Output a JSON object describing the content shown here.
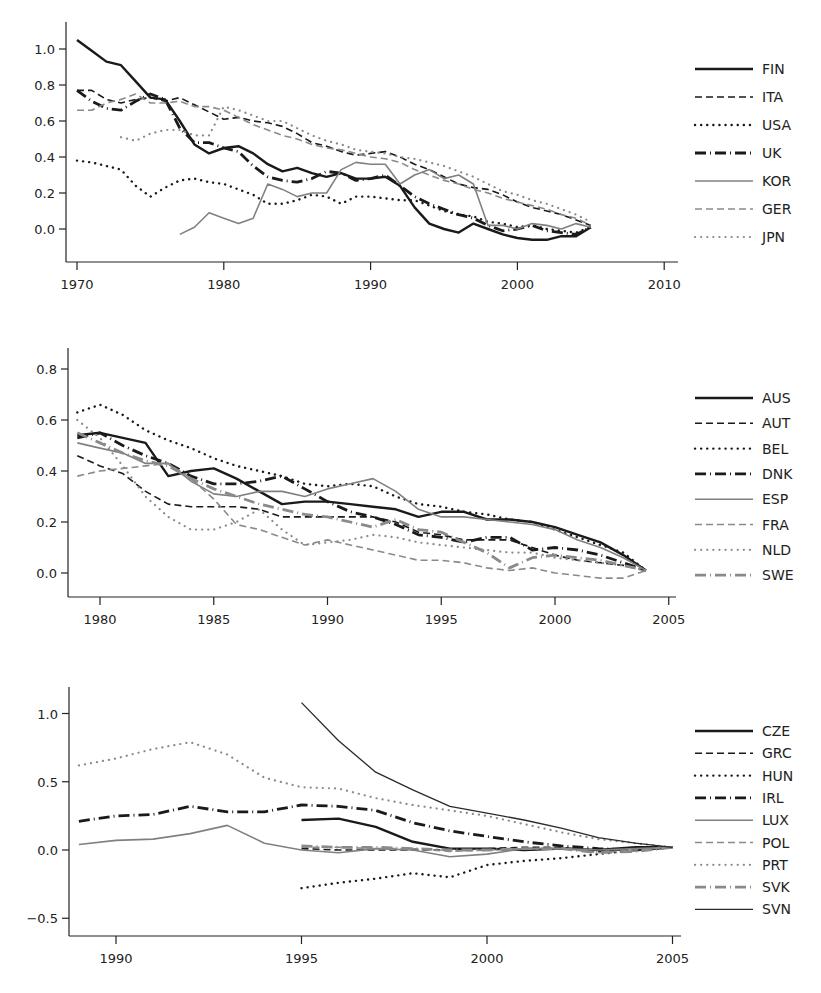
{
  "styles": {
    "solid_thick": {
      "color": "#1a1a1a",
      "width": 2.4,
      "dash": ""
    },
    "dash_dark": {
      "color": "#1a1a1a",
      "width": 1.6,
      "dash": "7,4"
    },
    "dot_dark": {
      "color": "#1a1a1a",
      "width": 2.4,
      "dash": "0.1,6",
      "cap": "round"
    },
    "dashdot_thick": {
      "color": "#1a1a1a",
      "width": 2.8,
      "dash": "11,4,1,4"
    },
    "solid_gray": {
      "color": "#808080",
      "width": 1.6,
      "dash": ""
    },
    "dash_gray": {
      "color": "#8a8a8a",
      "width": 1.6,
      "dash": "7,4"
    },
    "dot_gray": {
      "color": "#8a8a8a",
      "width": 2.2,
      "dash": "0.1,6",
      "cap": "round"
    },
    "dashdot_gray": {
      "color": "#8a8a8a",
      "width": 2.8,
      "dash": "11,4,1,4"
    },
    "solid_thin": {
      "color": "#2a2a2a",
      "width": 1.3,
      "dash": ""
    }
  },
  "chart_data": [
    {
      "type": "line",
      "title": "",
      "xlabel": "",
      "ylabel": "",
      "xlim": [
        1969.5,
        2010.5
      ],
      "ylim": [
        -0.2,
        1.15
      ],
      "x_ticks": [
        1970,
        1980,
        1990,
        2000,
        2010
      ],
      "y_ticks": [
        0.0,
        0.2,
        0.4,
        0.6,
        0.8,
        1.0
      ],
      "y_tick_labels": [
        "0.0",
        "0.2",
        "0.4",
        "0.6",
        "0.8",
        "1.0"
      ],
      "grid": false,
      "legend_position": "right",
      "frame": {
        "x0": 66,
        "x1": 678,
        "y_axis_top": 22,
        "y_axis_bottom": 262,
        "px_per_year": 14.68,
        "x_origin_year": 1970,
        "x_origin_px": 77,
        "y_zero_px": 229,
        "px_per_unit": 180
      },
      "legend": {
        "x": 695,
        "y0": 69,
        "dy": 28
      },
      "series": [
        {
          "name": "FIN",
          "style": "solid_thick",
          "start": 1970,
          "values": [
            1.05,
            0.99,
            0.93,
            0.91,
            0.82,
            0.73,
            0.72,
            0.6,
            0.47,
            0.42,
            0.45,
            0.46,
            0.42,
            0.36,
            0.32,
            0.34,
            0.31,
            0.29,
            0.31,
            0.28,
            0.28,
            0.29,
            0.24,
            0.12,
            0.03,
            0.0,
            -0.02,
            0.03,
            0.0,
            -0.03,
            -0.05,
            -0.06,
            -0.06,
            -0.04,
            -0.04,
            0.01
          ]
        },
        {
          "name": "ITA",
          "style": "dash_dark",
          "start": 1970,
          "values": [
            0.77,
            0.77,
            0.72,
            0.7,
            0.72,
            0.73,
            0.71,
            0.73,
            0.69,
            0.65,
            0.61,
            0.62,
            0.6,
            0.59,
            0.57,
            0.53,
            0.48,
            0.46,
            0.43,
            0.41,
            0.42,
            0.43,
            0.4,
            0.36,
            0.33,
            0.29,
            0.25,
            0.23,
            0.22,
            0.19,
            0.15,
            0.12,
            0.1,
            0.08,
            0.05,
            0.02
          ]
        },
        {
          "name": "USA",
          "style": "dot_dark",
          "start": 1970,
          "values": [
            0.38,
            0.37,
            0.35,
            0.33,
            0.24,
            0.18,
            0.23,
            0.27,
            0.28,
            0.26,
            0.25,
            0.22,
            0.19,
            0.14,
            0.14,
            0.16,
            0.19,
            0.18,
            0.14,
            0.18,
            0.18,
            0.17,
            0.16,
            0.16,
            0.13,
            0.1,
            0.08,
            0.07,
            0.04,
            0.03,
            0.01,
            0.02,
            0.0,
            -0.01,
            -0.02,
            0.01
          ]
        },
        {
          "name": "UK",
          "style": "dashdot_thick",
          "start": 1970,
          "values": [
            0.77,
            0.71,
            0.67,
            0.66,
            0.71,
            0.75,
            0.72,
            0.56,
            0.48,
            0.48,
            0.45,
            0.43,
            0.35,
            0.29,
            0.27,
            0.26,
            0.28,
            0.32,
            0.31,
            0.27,
            0.28,
            0.3,
            0.24,
            0.18,
            0.14,
            0.11,
            0.08,
            0.06,
            0.02,
            -0.01,
            0.0,
            0.02,
            -0.01,
            -0.02,
            -0.03,
            0.01
          ]
        },
        {
          "name": "KOR",
          "style": "solid_gray",
          "start": 1977,
          "values": [
            -0.03,
            0.01,
            0.09,
            0.06,
            0.03,
            0.06,
            0.25,
            0.22,
            0.18,
            0.2,
            0.2,
            0.33,
            0.37,
            0.36,
            0.36,
            0.25,
            0.3,
            0.33,
            0.28,
            0.3,
            0.25,
            0.02,
            0.02,
            0.0,
            0.03,
            0.02,
            0.0,
            0.03,
            0.01
          ]
        },
        {
          "name": "GER",
          "style": "dash_gray",
          "start": 1970,
          "values": [
            0.66,
            0.66,
            0.7,
            0.72,
            0.75,
            0.7,
            0.7,
            0.71,
            0.68,
            0.68,
            0.66,
            0.62,
            0.58,
            0.55,
            0.52,
            0.5,
            0.47,
            0.45,
            0.44,
            0.42,
            0.4,
            0.39,
            0.37,
            0.33,
            0.3,
            0.27,
            0.25,
            0.22,
            0.2,
            0.17,
            0.15,
            0.13,
            0.11,
            0.08,
            0.06,
            0.02
          ]
        },
        {
          "name": "JPN",
          "style": "dot_gray",
          "start": 1973,
          "values": [
            0.51,
            0.49,
            0.53,
            0.55,
            0.55,
            0.52,
            0.52,
            0.68,
            0.66,
            0.63,
            0.6,
            0.6,
            0.56,
            0.52,
            0.49,
            0.47,
            0.44,
            0.43,
            0.42,
            0.4,
            0.39,
            0.37,
            0.35,
            0.32,
            0.29,
            0.25,
            0.21,
            0.19,
            0.16,
            0.14,
            0.11,
            0.08,
            0.04
          ]
        }
      ]
    },
    {
      "type": "line",
      "title": "",
      "xlabel": "",
      "ylabel": "",
      "xlim": [
        1978.6,
        2005.2
      ],
      "ylim": [
        -0.1,
        0.87
      ],
      "x_ticks": [
        1980,
        1985,
        1990,
        1995,
        2000,
        2005
      ],
      "y_ticks": [
        0.0,
        0.2,
        0.4,
        0.6,
        0.8
      ],
      "y_tick_labels": [
        "0.0",
        "0.2",
        "0.4",
        "0.6",
        "0.8"
      ],
      "grid": false,
      "legend_position": "right",
      "frame": {
        "x0": 68,
        "x1": 676,
        "y_axis_top": 348,
        "y_axis_bottom": 597,
        "px_per_year": 22.75,
        "x_origin_year": 1980,
        "x_origin_px": 100,
        "y_zero_px": 573,
        "px_per_unit": 255
      },
      "legend": {
        "x": 695,
        "y0": 398,
        "dy": 25.3
      },
      "series": [
        {
          "name": "AUS",
          "style": "solid_thick",
          "start": 1979,
          "values": [
            0.54,
            0.55,
            0.53,
            0.51,
            0.38,
            0.4,
            0.41,
            0.37,
            0.32,
            0.27,
            0.28,
            0.28,
            0.27,
            0.26,
            0.25,
            0.22,
            0.24,
            0.24,
            0.21,
            0.21,
            0.2,
            0.18,
            0.15,
            0.12,
            0.07,
            0.01
          ]
        },
        {
          "name": "AUT",
          "style": "dash_dark",
          "start": 1979,
          "values": [
            0.46,
            0.42,
            0.39,
            0.32,
            0.27,
            0.26,
            0.26,
            0.26,
            0.25,
            0.22,
            0.22,
            0.22,
            0.22,
            0.22,
            0.2,
            0.16,
            0.15,
            0.13,
            0.13,
            0.13,
            0.1,
            0.07,
            0.05,
            0.04,
            0.03,
            0.01
          ]
        },
        {
          "name": "BEL",
          "style": "dot_dark",
          "start": 1979,
          "values": [
            0.63,
            0.66,
            0.62,
            0.56,
            0.52,
            0.49,
            0.45,
            0.42,
            0.4,
            0.38,
            0.35,
            0.34,
            0.35,
            0.34,
            0.3,
            0.27,
            0.26,
            0.24,
            0.23,
            0.21,
            0.2,
            0.17,
            0.14,
            0.11,
            0.08,
            0.01
          ]
        },
        {
          "name": "DNK",
          "style": "dashdot_thick",
          "start": 1979,
          "values": [
            0.53,
            0.55,
            0.5,
            0.46,
            0.43,
            0.38,
            0.35,
            0.35,
            0.36,
            0.38,
            0.33,
            0.28,
            0.24,
            0.22,
            0.19,
            0.15,
            0.14,
            0.12,
            0.14,
            0.14,
            0.09,
            0.1,
            0.09,
            0.07,
            0.04,
            0.01
          ]
        },
        {
          "name": "ESP",
          "style": "solid_gray",
          "start": 1979,
          "values": [
            0.51,
            0.49,
            0.47,
            0.43,
            0.43,
            0.36,
            0.31,
            0.3,
            0.32,
            0.32,
            0.3,
            0.33,
            0.35,
            0.37,
            0.32,
            0.25,
            0.22,
            0.22,
            0.21,
            0.2,
            0.19,
            0.17,
            0.13,
            0.1,
            0.06,
            0.01
          ]
        },
        {
          "name": "FRA",
          "style": "dash_gray",
          "start": 1979,
          "values": [
            0.38,
            0.4,
            0.41,
            0.42,
            0.43,
            0.37,
            0.29,
            0.19,
            0.17,
            0.14,
            0.11,
            0.13,
            0.11,
            0.09,
            0.07,
            0.05,
            0.05,
            0.04,
            0.02,
            0.01,
            0.02,
            0.0,
            -0.01,
            -0.02,
            -0.02,
            0.01
          ]
        },
        {
          "name": "NLD",
          "style": "dot_gray",
          "start": 1979,
          "values": [
            0.6,
            0.53,
            0.42,
            0.3,
            0.22,
            0.17,
            0.17,
            0.2,
            0.25,
            0.17,
            0.11,
            0.12,
            0.13,
            0.15,
            0.14,
            0.12,
            0.11,
            0.1,
            0.09,
            0.08,
            0.08,
            0.06,
            0.05,
            0.04,
            0.03,
            0.01
          ]
        },
        {
          "name": "SWE",
          "style": "dashdot_gray",
          "start": 1979,
          "values": [
            0.55,
            0.51,
            0.47,
            0.44,
            0.42,
            0.37,
            0.33,
            0.3,
            0.27,
            0.25,
            0.23,
            0.22,
            0.2,
            0.18,
            0.21,
            0.17,
            0.16,
            0.12,
            0.08,
            0.02,
            0.06,
            0.07,
            0.06,
            0.05,
            0.03,
            0.01
          ]
        }
      ]
    },
    {
      "type": "line",
      "title": "",
      "xlabel": "",
      "ylabel": "",
      "xlim": [
        1988.7,
        2005.3
      ],
      "ylim": [
        -0.63,
        1.2
      ],
      "x_ticks": [
        1990,
        1995,
        2000,
        2005
      ],
      "y_ticks": [
        -0.5,
        0.0,
        0.5,
        1.0
      ],
      "y_tick_labels": [
        "−0.5",
        "0.0",
        "0.5",
        "1.0"
      ],
      "grid": false,
      "legend_position": "right",
      "frame": {
        "x0": 69,
        "x1": 681,
        "y_axis_top": 687,
        "y_axis_bottom": 936,
        "px_per_year": 37.1,
        "x_origin_year": 1990,
        "x_origin_px": 116,
        "y_zero_px": 850,
        "px_per_unit": 136.5
      },
      "legend": {
        "x": 695,
        "y0": 731,
        "dy": 22.3
      },
      "series": [
        {
          "name": "CZE",
          "style": "solid_thick",
          "start": 1995,
          "values": [
            0.22,
            0.23,
            0.17,
            0.06,
            0.01,
            0.01,
            0.0,
            0.01,
            0.0,
            0.02,
            0.02
          ]
        },
        {
          "name": "GRC",
          "style": "dash_dark",
          "start": 1995,
          "values": [
            0.01,
            0.0,
            0.0,
            0.0,
            0.0,
            0.01,
            0.02,
            0.02,
            -0.01,
            0.01,
            0.02
          ]
        },
        {
          "name": "HUN",
          "style": "dot_dark",
          "start": 1995,
          "values": [
            -0.28,
            -0.24,
            -0.21,
            -0.17,
            -0.2,
            -0.11,
            -0.08,
            -0.06,
            -0.03,
            0.0,
            0.02
          ]
        },
        {
          "name": "IRL",
          "style": "dashdot_thick",
          "start": 1989,
          "values": [
            0.21,
            0.25,
            0.26,
            0.32,
            0.28,
            0.28,
            0.33,
            0.32,
            0.29,
            0.2,
            0.14,
            0.1,
            0.06,
            0.03,
            0.01,
            0.0,
            0.02
          ]
        },
        {
          "name": "LUX",
          "style": "solid_gray",
          "start": 1989,
          "values": [
            0.04,
            0.07,
            0.08,
            0.12,
            0.18,
            0.05,
            0.0,
            -0.02,
            0.01,
            0.0,
            -0.05,
            -0.03,
            0.01,
            0.01,
            0.0,
            0.01,
            0.02
          ]
        },
        {
          "name": "POL",
          "style": "dash_gray",
          "start": 1995,
          "values": [
            0.02,
            0.02,
            0.01,
            0.01,
            -0.01,
            0.0,
            0.01,
            0.01,
            -0.02,
            0.0,
            0.02
          ]
        },
        {
          "name": "PRT",
          "style": "dot_gray",
          "start": 1989,
          "values": [
            0.62,
            0.67,
            0.74,
            0.79,
            0.7,
            0.53,
            0.46,
            0.45,
            0.38,
            0.33,
            0.29,
            0.25,
            0.19,
            0.13,
            0.08,
            0.05,
            0.02
          ]
        },
        {
          "name": "SVK",
          "style": "dashdot_gray",
          "start": 1995,
          "values": [
            0.03,
            0.02,
            0.02,
            0.01,
            0.0,
            0.0,
            0.01,
            0.01,
            -0.02,
            -0.01,
            0.02
          ]
        },
        {
          "name": "SVN",
          "style": "solid_thin",
          "start": 1995,
          "values": [
            1.08,
            0.8,
            0.57,
            0.44,
            0.32,
            0.27,
            0.22,
            0.16,
            0.09,
            0.05,
            0.02
          ]
        }
      ]
    }
  ]
}
